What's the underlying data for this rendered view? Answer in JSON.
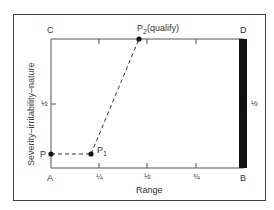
{
  "diagram": {
    "corners": {
      "A": "A",
      "B": "B",
      "C": "C",
      "D": "D"
    },
    "axes": {
      "x_label": "Range",
      "y_label": "Severity–irritability–nature",
      "x_ticks": [
        "¼",
        "½",
        "¾"
      ],
      "y_ticks": [
        "½"
      ],
      "right_tick": "½"
    },
    "points": {
      "P": "P",
      "P1": "P",
      "P1_sub": "1",
      "P2": "P",
      "P2_sub": "2",
      "P2_note": "(qualify)"
    },
    "colors": {
      "line": "#333333",
      "bar": "#111111",
      "frame": "#444444"
    }
  }
}
